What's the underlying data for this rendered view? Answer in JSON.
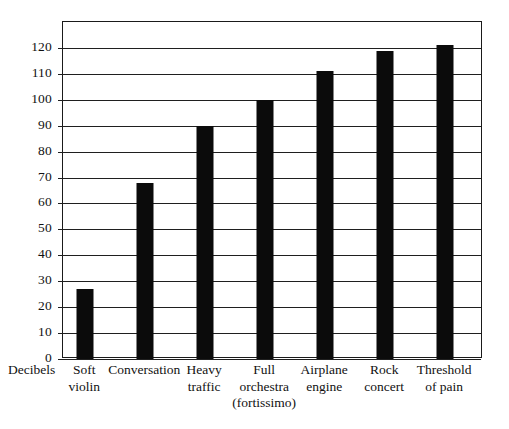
{
  "chart_data": {
    "type": "bar",
    "title": "",
    "xlabel": "",
    "ylabel": "Decibels",
    "categories": [
      "Soft violin",
      "Conversation",
      "Heavy traffic",
      "Full orchestra (fortissimo)",
      "Airplane engine",
      "Rock concert",
      "Threshold of pain"
    ],
    "category_lines": [
      [
        "Soft",
        "violin"
      ],
      [
        "Conversation"
      ],
      [
        "Heavy",
        "traffic"
      ],
      [
        "Full",
        "orchestra",
        "(fortissimo)"
      ],
      [
        "Airplane",
        "engine"
      ],
      [
        "Rock",
        "concert"
      ],
      [
        "Threshold",
        "of pain"
      ]
    ],
    "values": [
      27,
      68,
      90,
      100,
      111,
      119,
      121
    ],
    "ylim": [
      0,
      130
    ],
    "y_ticks": [
      0,
      10,
      20,
      30,
      40,
      50,
      60,
      70,
      80,
      90,
      100,
      110,
      120
    ],
    "grid": true,
    "legend": "none",
    "bar_color": "#0b0b0b",
    "axis_color": "#1f1f1f",
    "background_color": "#ffffff"
  },
  "axis": {
    "y_label_text": "Decibels",
    "tick_labels": [
      "120",
      "110",
      "100",
      "90",
      "80",
      "70",
      "60",
      "50",
      "40",
      "30",
      "20",
      "10",
      "0"
    ]
  }
}
